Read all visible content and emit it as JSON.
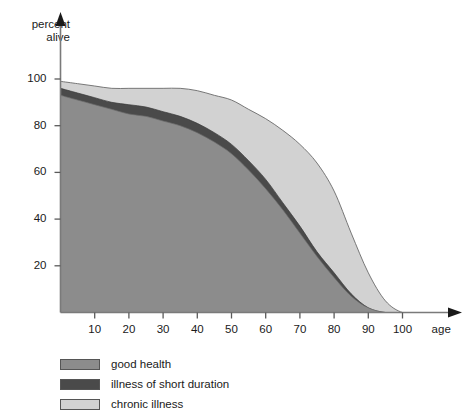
{
  "chart_data": {
    "type": "area",
    "title": "",
    "subtitle": "",
    "xlabel": "age",
    "ylabel": "percent alive",
    "xlim": [
      0,
      105
    ],
    "ylim": [
      0,
      105
    ],
    "grid": false,
    "legend_position": "bottom-left",
    "x_ticks": [
      10,
      20,
      30,
      40,
      50,
      60,
      70,
      80,
      90,
      100
    ],
    "y_ticks": [
      20,
      40,
      60,
      80,
      100
    ],
    "stacked": true,
    "x": [
      0,
      5,
      10,
      15,
      20,
      25,
      30,
      35,
      40,
      45,
      50,
      55,
      60,
      65,
      70,
      75,
      80,
      85,
      90,
      95,
      100,
      105
    ],
    "series": [
      {
        "name": "good health",
        "color": "#8c8c8c",
        "values": [
          93,
          91,
          89,
          87,
          85,
          84,
          82,
          80,
          77,
          73,
          68,
          61,
          53,
          44,
          34,
          24,
          15,
          7,
          2,
          0,
          0,
          0
        ]
      },
      {
        "name": "illness of short duration",
        "color": "#4a4a4a",
        "values": [
          3,
          3,
          3,
          3,
          4,
          4,
          4,
          4,
          4,
          4,
          4,
          4,
          4,
          3,
          3,
          2,
          2,
          1,
          0,
          0,
          0,
          0
        ]
      },
      {
        "name": "chronic illness",
        "color": "#c6c6c6",
        "values": [
          3,
          4,
          5,
          6,
          7,
          8,
          10,
          12,
          14,
          16,
          19,
          22,
          26,
          31,
          35,
          38,
          35,
          26,
          15,
          5,
          0,
          0
        ]
      }
    ],
    "cumulative_top": {
      "good_health": [
        93,
        91,
        89,
        87,
        85,
        84,
        82,
        80,
        77,
        73,
        68,
        61,
        53,
        44,
        34,
        24,
        15,
        7,
        2,
        0,
        0,
        0
      ],
      "plus_short_illness": [
        96,
        94,
        92,
        90,
        89,
        88,
        86,
        84,
        81,
        77,
        72,
        65,
        57,
        47,
        37,
        26,
        17,
        8,
        2,
        0,
        0,
        0
      ],
      "plus_chronic": [
        99,
        98,
        97,
        96,
        96,
        96,
        96,
        96,
        95,
        93,
        91,
        87,
        83,
        78,
        72,
        64,
        52,
        34,
        17,
        5,
        0,
        0
      ]
    }
  },
  "axes": {
    "y_title_line1": "percent",
    "y_title_line2": "alive",
    "x_title": "age",
    "y_tick_labels": [
      "100",
      "80",
      "60",
      "40",
      "20"
    ],
    "x_tick_labels": [
      "10",
      "20",
      "30",
      "40",
      "50",
      "60",
      "70",
      "80",
      "90",
      "100"
    ]
  },
  "legend": {
    "items": [
      {
        "label": "good health",
        "color": "#8c8c8c"
      },
      {
        "label": "illness of short duration",
        "color": "#4a4a4a"
      },
      {
        "label": "chronic illness",
        "color": "#d2d2d2"
      }
    ]
  },
  "colors": {
    "good_health": "#8c8c8c",
    "short_illness": "#4a4a4a",
    "chronic_illness": "#d2d2d2",
    "axis": "#6e6e6e",
    "text": "#1a1a1a",
    "outline": "#555555",
    "background": "#ffffff"
  }
}
